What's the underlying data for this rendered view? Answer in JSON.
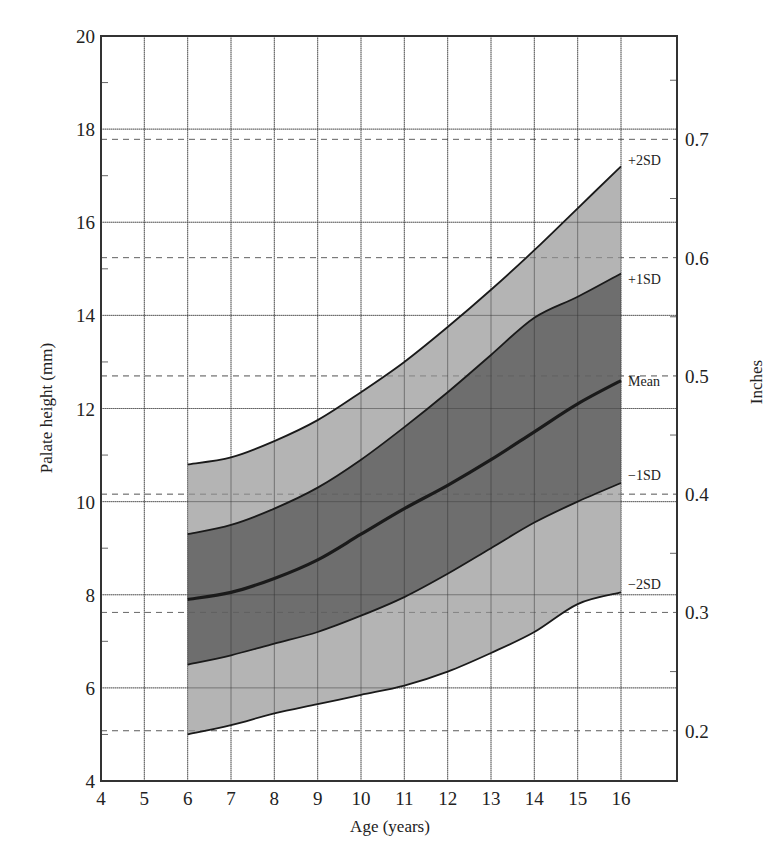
{
  "chart_data": {
    "type": "area",
    "title": "",
    "xlabel": "Age (years)",
    "ylabel": "Palate height (mm)",
    "ylabel_right": "Inches",
    "xlim": [
      4,
      16
    ],
    "ylim": [
      4,
      20
    ],
    "x_ticks": [
      4,
      5,
      6,
      7,
      8,
      9,
      10,
      11,
      12,
      13,
      14,
      15,
      16
    ],
    "y_ticks": [
      4,
      6,
      8,
      10,
      12,
      14,
      16,
      18,
      20
    ],
    "y_right_ticks": [
      "0.2",
      "0.3",
      "0.4",
      "0.5",
      "0.6",
      "0.7"
    ],
    "y_right_values_mm": [
      5.08,
      7.62,
      10.16,
      12.7,
      15.24,
      17.78
    ],
    "grid": true,
    "legend_position": "inline-right",
    "x": [
      6,
      7,
      8,
      9,
      10,
      11,
      12,
      13,
      14,
      15,
      16
    ],
    "series": [
      {
        "name": "+2SD",
        "label": "+2SD",
        "values": [
          10.8,
          10.95,
          11.3,
          11.75,
          12.35,
          13.0,
          13.75,
          14.55,
          15.4,
          16.3,
          17.2
        ]
      },
      {
        "name": "+1SD",
        "label": "+1SD",
        "values": [
          9.3,
          9.5,
          9.85,
          10.3,
          10.9,
          11.6,
          12.35,
          13.15,
          13.95,
          14.4,
          14.9
        ]
      },
      {
        "name": "Mean",
        "label": "Mean",
        "values": [
          7.9,
          8.05,
          8.35,
          8.75,
          9.3,
          9.85,
          10.35,
          10.9,
          11.5,
          12.1,
          12.6
        ]
      },
      {
        "name": "-1SD",
        "label": "−1SD",
        "values": [
          6.5,
          6.7,
          6.95,
          7.2,
          7.55,
          7.95,
          8.45,
          9.0,
          9.55,
          10.0,
          10.4
        ]
      },
      {
        "name": "-2SD",
        "label": "−2SD",
        "values": [
          5.0,
          5.2,
          5.45,
          5.65,
          5.85,
          6.05,
          6.35,
          6.75,
          7.2,
          7.8,
          8.05
        ]
      }
    ],
    "bands": [
      {
        "between": [
          "+2SD",
          "-2SD"
        ],
        "fill": "#b4b4b4"
      },
      {
        "between": [
          "+1SD",
          "-1SD"
        ],
        "fill": "#6e6e6e"
      }
    ],
    "colors": {
      "outer_band": "#b4b4b4",
      "inner_band": "#6e6e6e",
      "line": "#1a1a1a",
      "grid": "#8a8a8a",
      "axis": "#333333"
    }
  }
}
